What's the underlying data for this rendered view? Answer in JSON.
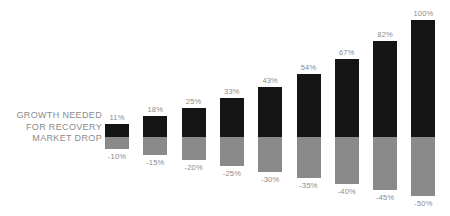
{
  "legend": {
    "lines": [
      "GROWTH NEEDED",
      "FOR RECOVERY",
      "MARKET DROP"
    ]
  },
  "colors": {
    "growth": "#151515",
    "drop": "#8a8a8a",
    "text": "#8c8c8c",
    "background": "#ffffff"
  },
  "chart_data": {
    "type": "bar",
    "title": "",
    "subtitle": "",
    "xlabel": "",
    "ylabel": "",
    "grid": false,
    "legend_position": "left",
    "stacked": true,
    "baseline": 0,
    "ylim": [
      -50,
      100
    ],
    "categories": [
      "-10%",
      "-15%",
      "-20%",
      "-25%",
      "-30%",
      "-35%",
      "-40%",
      "-45%",
      "-50%"
    ],
    "series": [
      {
        "name": "GROWTH NEEDED FOR RECOVERY",
        "color": "#151515",
        "values": [
          11,
          18,
          25,
          33,
          43,
          54,
          67,
          82,
          100
        ],
        "labels": [
          "11%",
          "18%",
          "25%",
          "33%",
          "43%",
          "54%",
          "67%",
          "82%",
          "100%"
        ]
      },
      {
        "name": "MARKET DROP",
        "color": "#8a8a8a",
        "values": [
          -10,
          -15,
          -20,
          -25,
          -30,
          -35,
          -40,
          -45,
          -50
        ],
        "labels": [
          "-10%",
          "-15%",
          "-20%",
          "-25%",
          "-30%",
          "-35%",
          "-40%",
          "-45%",
          "-50%"
        ]
      }
    ]
  }
}
